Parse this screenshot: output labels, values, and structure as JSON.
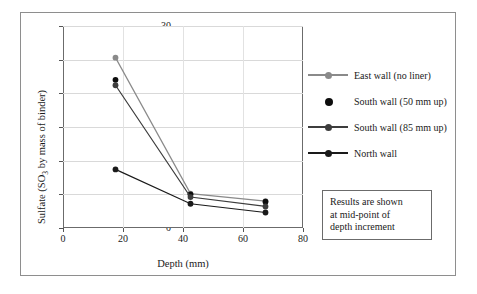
{
  "chart_data": {
    "type": "line",
    "title": "",
    "xlabel": "Depth (mm)",
    "ylabel": "Sulfate (SO3 by mass of binder)",
    "ylabel_parts": {
      "pre": "Sulfate (SO",
      "sub": "3",
      "post": " by mass of binder)"
    },
    "xlim": [
      0,
      80
    ],
    "ylim": [
      0,
      30
    ],
    "xticks": [
      0,
      20,
      40,
      60,
      80
    ],
    "yticks": [
      0,
      5,
      10,
      15,
      20,
      25,
      30
    ],
    "grid": "horizontal-and-vertical",
    "legend_position": "right",
    "x": [
      17.5,
      42.5,
      67.5
    ],
    "series": [
      {
        "name": "East wall (no liner)",
        "values": [
          25.3,
          5.1,
          4.0
        ],
        "color": "#8a8a8a",
        "marker": "circle",
        "line": true
      },
      {
        "name": "South wall (50 mm up)",
        "values": [
          22.0,
          5.0,
          3.9
        ],
        "color": "#0d0d0d",
        "marker": "circle",
        "line": false
      },
      {
        "name": "South wall (85 mm up)",
        "values": [
          21.2,
          4.6,
          3.2
        ],
        "color": "#3d3d3d",
        "marker": "circle",
        "line": true
      },
      {
        "name": "North wall",
        "values": [
          8.7,
          3.6,
          2.3
        ],
        "color": "#1a1a1a",
        "marker": "circle",
        "line": true
      }
    ]
  },
  "legend": {
    "items": [
      {
        "label": "East wall (no liner)",
        "color": "#8a8a8a",
        "style": "line-marker"
      },
      {
        "label": "South wall (50 mm up)",
        "color": "#0d0d0d",
        "style": "marker-only"
      },
      {
        "label": "South wall (85 mm up)",
        "color": "#3d3d3d",
        "style": "line-marker"
      },
      {
        "label": "North wall",
        "color": "#1a1a1a",
        "style": "line-marker"
      }
    ]
  },
  "note_box": {
    "lines": [
      "Results are shown",
      "at mid-point of",
      "depth increment"
    ]
  },
  "axis_labels": {
    "x_title": "Depth (mm)",
    "y_title_pre": "Sulfate (SO",
    "y_title_sub": "3",
    "y_title_post": " by mass of binder)",
    "xticks": [
      "0",
      "20",
      "40",
      "60",
      "80"
    ],
    "yticks": [
      "0",
      "5",
      "10",
      "15",
      "20",
      "25",
      "30"
    ]
  }
}
